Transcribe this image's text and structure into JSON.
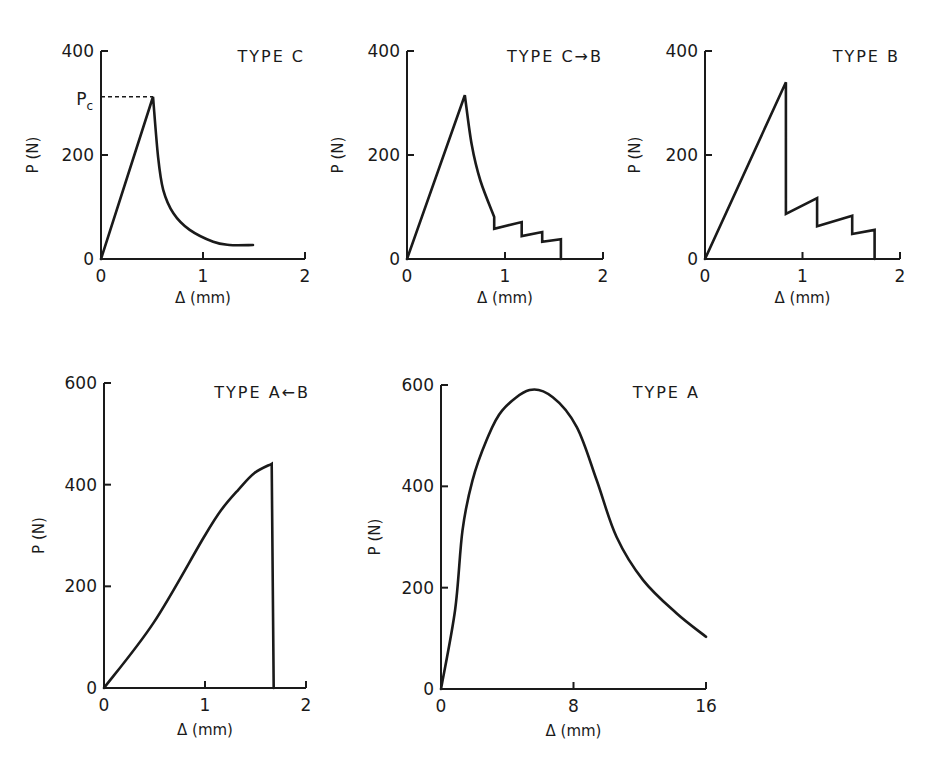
{
  "chart_data": [
    {
      "type": "line",
      "title": "TYPE C",
      "xlabel": "Δ (mm)",
      "ylabel": "P (N)",
      "xlim": [
        0,
        2
      ],
      "ylim": [
        0,
        400
      ],
      "xticks": [
        0,
        1,
        2
      ],
      "xtick_labels": [
        "0",
        "1",
        "2"
      ],
      "yticks": [
        0,
        200,
        400
      ],
      "ytick_labels": [
        "0",
        "200",
        "400"
      ],
      "annotation": {
        "label": "P",
        "subscript": "c",
        "value": 312
      },
      "series": [
        {
          "name": "Type C",
          "x": [
            0,
            0.51,
            0.56,
            0.61,
            0.71,
            0.87,
            1.1,
            1.26,
            1.49
          ],
          "y": [
            0,
            312,
            196,
            133,
            88,
            56,
            33,
            27,
            27
          ],
          "smooth_from_index": 1
        }
      ]
    },
    {
      "type": "line",
      "title": "TYPE C→B",
      "xlabel": "Δ (mm)",
      "ylabel": "P (N)",
      "xlim": [
        0,
        2
      ],
      "ylim": [
        0,
        400
      ],
      "xticks": [
        0,
        1,
        2
      ],
      "xtick_labels": [
        "0",
        "1",
        "2"
      ],
      "yticks": [
        0,
        200,
        400
      ],
      "ytick_labels": [
        "0",
        "200",
        "400"
      ],
      "series": [
        {
          "name": "Type C→B",
          "x": [
            0,
            0.59,
            0.66,
            0.75,
            0.89,
            0.89,
            1.17,
            1.17,
            1.38,
            1.38,
            1.57,
            1.57
          ],
          "y": [
            0,
            315,
            220,
            150,
            81,
            58,
            71,
            44,
            52,
            33,
            38,
            0
          ],
          "smooth_range": [
            1,
            4
          ]
        }
      ]
    },
    {
      "type": "line",
      "title": "TYPE B",
      "xlabel": "Δ (mm)",
      "ylabel": "P (N)",
      "xlim": [
        0,
        2
      ],
      "ylim": [
        0,
        400
      ],
      "xticks": [
        0,
        1,
        2
      ],
      "xtick_labels": [
        "0",
        "1",
        "2"
      ],
      "yticks": [
        0,
        200,
        400
      ],
      "ytick_labels": [
        "0",
        "200",
        "400"
      ],
      "series": [
        {
          "name": "Type B",
          "x": [
            0,
            0.83,
            0.83,
            1.15,
            1.15,
            1.51,
            1.51,
            1.74,
            1.74
          ],
          "y": [
            0,
            340,
            87,
            117,
            63,
            83,
            48,
            56,
            0
          ]
        }
      ]
    },
    {
      "type": "line",
      "title": "TYPE A←B",
      "xlabel": "Δ (mm)",
      "ylabel": "P (N)",
      "xlim": [
        0,
        2
      ],
      "ylim": [
        0,
        600
      ],
      "xticks": [
        0,
        1,
        2
      ],
      "xtick_labels": [
        "0",
        "1",
        "2"
      ],
      "yticks": [
        0,
        200,
        400,
        600
      ],
      "ytick_labels": [
        "0",
        "200",
        "400",
        "600"
      ],
      "series": [
        {
          "name": "Type A←B",
          "x": [
            0,
            0.49,
            0.99,
            1.16,
            1.33,
            1.49,
            1.66,
            1.68
          ],
          "y": [
            0,
            128,
            297,
            350,
            390,
            423,
            441,
            0
          ]
        }
      ]
    },
    {
      "type": "line",
      "title": "TYPE A",
      "xlabel": "Δ (mm)",
      "ylabel": "P (N)",
      "xlim": [
        0,
        16
      ],
      "ylim": [
        0,
        600
      ],
      "xticks": [
        0,
        8,
        16
      ],
      "xtick_labels": [
        "0",
        "8",
        "16"
      ],
      "yticks": [
        0,
        200,
        400,
        600
      ],
      "ytick_labels": [
        "0",
        "200",
        "400",
        "600"
      ],
      "series": [
        {
          "name": "Type A",
          "x": [
            0,
            0.85,
            1.3,
            1.9,
            2.75,
            3.7,
            5.35,
            6.75,
            8.2,
            9.4,
            10.6,
            12.2,
            14.2,
            16.0
          ],
          "y": [
            0,
            156,
            313,
            412,
            491,
            550,
            590,
            576,
            517,
            412,
            300,
            215,
            150,
            103
          ]
        }
      ]
    }
  ]
}
